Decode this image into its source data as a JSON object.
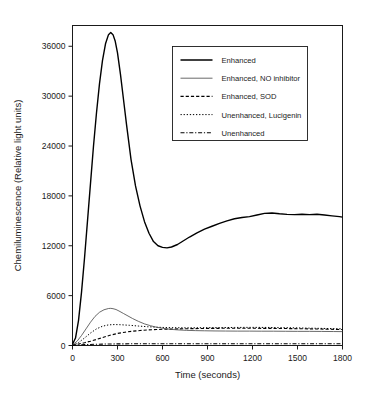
{
  "chart_data": {
    "type": "line",
    "title": "",
    "xlabel": "Time (seconds)",
    "ylabel": "Chemiluminescence (Relative light units)",
    "xlim": [
      0,
      1800
    ],
    "ylim": [
      0,
      38500
    ],
    "xticks": [
      0,
      300,
      600,
      900,
      1200,
      1500,
      1800
    ],
    "xticklabels": [
      "0",
      "300",
      "600",
      "900",
      "1200",
      "1500",
      "1800"
    ],
    "yticks": [
      0,
      6000,
      12000,
      18000,
      24000,
      30000,
      36000
    ],
    "yticklabels": [
      "0",
      "6000",
      "12000",
      "18000",
      "24000",
      "30000",
      "36000"
    ],
    "grid": false,
    "legend_position": "upper right",
    "series": [
      {
        "name": "Enhanced",
        "style": "solid",
        "color": "#000000",
        "width": 1.4,
        "x": [
          0,
          20,
          40,
          60,
          80,
          100,
          120,
          140,
          160,
          180,
          200,
          220,
          240,
          255,
          270,
          285,
          300,
          320,
          340,
          360,
          390,
          420,
          450,
          480,
          510,
          540,
          570,
          600,
          630,
          660,
          700,
          740,
          780,
          830,
          880,
          930,
          980,
          1030,
          1080,
          1130,
          1180,
          1230,
          1280,
          1330,
          1380,
          1430,
          1480,
          1530,
          1580,
          1630,
          1680,
          1730,
          1780,
          1800
        ],
        "y": [
          150,
          900,
          3000,
          6400,
          10500,
          15000,
          19500,
          24000,
          28000,
          31500,
          34300,
          36300,
          37400,
          37650,
          37400,
          36600,
          35200,
          32600,
          29600,
          26600,
          22400,
          19200,
          16800,
          14900,
          13500,
          12500,
          12000,
          11800,
          11750,
          11850,
          12150,
          12600,
          13050,
          13550,
          14000,
          14350,
          14700,
          15000,
          15250,
          15400,
          15500,
          15700,
          15900,
          15950,
          15850,
          15780,
          15750,
          15800,
          15750,
          15800,
          15700,
          15600,
          15500,
          15450
        ]
      },
      {
        "name": "Enhanced, NO inhibitor",
        "style": "solid-thin",
        "color": "#444444",
        "width": 0.8,
        "x": [
          0,
          30,
          60,
          90,
          120,
          150,
          180,
          210,
          240,
          255,
          270,
          290,
          310,
          340,
          370,
          400,
          440,
          480,
          520,
          560,
          600,
          650,
          700,
          760,
          820,
          880,
          950,
          1020,
          1100,
          1180,
          1260,
          1340,
          1420,
          1500,
          1580,
          1660,
          1740,
          1800
        ],
        "y": [
          80,
          500,
          1200,
          2000,
          2800,
          3500,
          4000,
          4300,
          4450,
          4470,
          4430,
          4330,
          4150,
          3850,
          3550,
          3250,
          2900,
          2600,
          2380,
          2200,
          2080,
          1950,
          1880,
          1820,
          1790,
          1770,
          1750,
          1740,
          1730,
          1730,
          1720,
          1720,
          1710,
          1700,
          1700,
          1690,
          1680,
          1670
        ]
      },
      {
        "name": "Enhanced,  SOD",
        "style": "dashed",
        "color": "#000000",
        "width": 1.1,
        "x": [
          0,
          40,
          80,
          120,
          160,
          200,
          250,
          300,
          350,
          400,
          450,
          500,
          560,
          620,
          680,
          740,
          800,
          870,
          940,
          1010,
          1080,
          1150,
          1220,
          1300,
          1380,
          1460,
          1540,
          1620,
          1700,
          1780,
          1800
        ],
        "y": [
          60,
          180,
          330,
          520,
          730,
          950,
          1230,
          1450,
          1600,
          1720,
          1800,
          1870,
          1920,
          1960,
          1990,
          2010,
          2030,
          2050,
          2060,
          2070,
          2080,
          2080,
          2070,
          2060,
          2050,
          2030,
          2010,
          1990,
          1960,
          1930,
          1920
        ]
      },
      {
        "name": "Unenhanced, Lucigenin",
        "style": "dotted",
        "color": "#000000",
        "width": 1.0,
        "x": [
          0,
          40,
          80,
          120,
          160,
          200,
          240,
          280,
          320,
          380,
          440,
          500,
          560,
          620,
          680,
          740,
          800,
          870,
          940,
          1010,
          1080,
          1150,
          1230,
          1310,
          1390,
          1470,
          1550,
          1630,
          1710,
          1790,
          1800
        ],
        "y": [
          40,
          350,
          900,
          1500,
          2000,
          2320,
          2480,
          2520,
          2500,
          2430,
          2340,
          2260,
          2200,
          2160,
          2140,
          2130,
          2130,
          2140,
          2150,
          2160,
          2170,
          2180,
          2180,
          2170,
          2150,
          2130,
          2100,
          2070,
          2040,
          2010,
          2000
        ]
      },
      {
        "name": "Unenhanced",
        "style": "dashdot",
        "color": "#000000",
        "width": 1.1,
        "x": [
          0,
          100,
          200,
          300,
          400,
          500,
          600,
          700,
          800,
          900,
          1000,
          1100,
          1200,
          1300,
          1400,
          1500,
          1600,
          1700,
          1800
        ],
        "y": [
          30,
          120,
          170,
          195,
          205,
          210,
          215,
          215,
          215,
          215,
          215,
          215,
          215,
          215,
          215,
          215,
          215,
          215,
          215
        ]
      }
    ]
  },
  "legend": {
    "entries": [
      {
        "label": "Enhanced"
      },
      {
        "label": "Enhanced, NO inhibitor"
      },
      {
        "label": "Enhanced,  SOD"
      },
      {
        "label": "Unenhanced, Lucigenin"
      },
      {
        "label": "Unenhanced"
      }
    ]
  }
}
